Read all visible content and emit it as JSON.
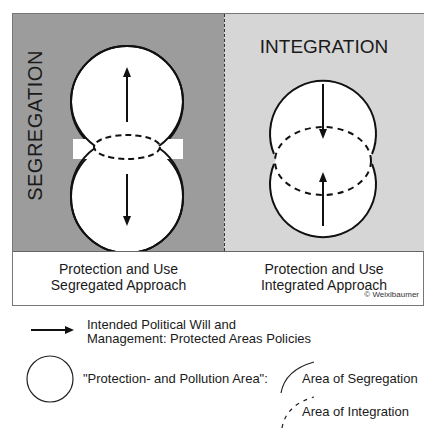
{
  "panels": {
    "left": {
      "title": "SEGREGATION",
      "caption_line1": "Protection and Use",
      "caption_line2": "Segregated Approach",
      "bg_color": "#9c9c9c"
    },
    "right": {
      "title": "INTEGRATION",
      "caption_line1": "Protection and Use",
      "caption_line2": "Integrated Approach",
      "bg_color": "#d6d6d6"
    }
  },
  "copyright": "© Weixlbaumer",
  "legend": {
    "arrow_line1": "Intended Political Will and",
    "arrow_line2": "Management: Protected Areas Policies",
    "circle_label": "\"Protection- and Pollution Area\":",
    "solid_arc_label": "Area of Segregation",
    "dashed_arc_label": "Area of Integration"
  }
}
